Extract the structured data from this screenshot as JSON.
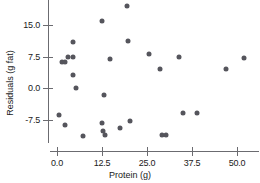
{
  "chart_data": {
    "type": "scatter",
    "title": "",
    "xlabel": "Protein (g)",
    "ylabel": "Residuals (g fat)",
    "xticks": [
      0.0,
      12.5,
      25.0,
      37.5,
      50.0
    ],
    "xtick_labels": [
      "0.0",
      "12.5",
      "25.0",
      "37.5",
      "50.0"
    ],
    "yticks": [
      -7.5,
      0.0,
      7.5,
      15.0
    ],
    "ytick_labels": [
      "-7.5",
      "0.0",
      "7.5",
      "15.0"
    ],
    "xlim": [
      -2.0,
      56.0
    ],
    "ylim": [
      -13.0,
      21.0
    ],
    "grid": false,
    "legend": null,
    "marker_color": "#55555c",
    "axis_color": "#6b6b70",
    "points": [
      {
        "x": 0.6,
        "y": -6.5
      },
      {
        "x": 2.2,
        "y": -8.7
      },
      {
        "x": 1.4,
        "y": 6.3
      },
      {
        "x": 2.2,
        "y": 6.3
      },
      {
        "x": 3.1,
        "y": 7.4
      },
      {
        "x": 4.4,
        "y": 7.4
      },
      {
        "x": 4.4,
        "y": 11.0
      },
      {
        "x": 4.4,
        "y": 3.1
      },
      {
        "x": 5.3,
        "y": 0.0
      },
      {
        "x": 7.2,
        "y": -11.5
      },
      {
        "x": 12.5,
        "y": 16.0
      },
      {
        "x": 12.5,
        "y": -8.4
      },
      {
        "x": 13.0,
        "y": -1.7
      },
      {
        "x": 12.9,
        "y": -10.2
      },
      {
        "x": 13.3,
        "y": -11.3
      },
      {
        "x": 14.8,
        "y": 6.8
      },
      {
        "x": 17.6,
        "y": -9.6
      },
      {
        "x": 19.4,
        "y": 19.5
      },
      {
        "x": 19.8,
        "y": 11.3
      },
      {
        "x": 20.3,
        "y": -7.9
      },
      {
        "x": 25.6,
        "y": 8.0
      },
      {
        "x": 28.6,
        "y": 4.5
      },
      {
        "x": 29.3,
        "y": -11.2
      },
      {
        "x": 30.4,
        "y": -11.2
      },
      {
        "x": 34.0,
        "y": 7.5
      },
      {
        "x": 35.0,
        "y": -5.9
      },
      {
        "x": 39.0,
        "y": -5.9
      },
      {
        "x": 47.0,
        "y": 4.5
      },
      {
        "x": 52.0,
        "y": 7.2
      }
    ]
  }
}
